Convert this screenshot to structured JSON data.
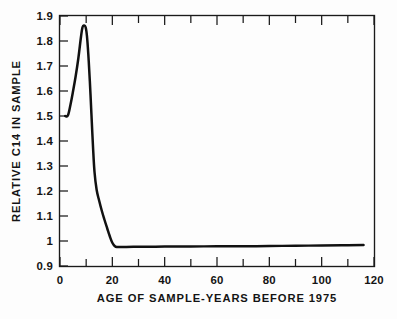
{
  "figure": {
    "background_color": "#fdfdfd",
    "ink_color": "#141414"
  },
  "chart_data": {
    "type": "line",
    "title": "",
    "subtitle": "",
    "xlabel": "AGE OF SAMPLE-YEARS BEFORE 1975",
    "ylabel": "RELATIVE C14 IN SAMPLE",
    "xlim": [
      0,
      120
    ],
    "ylim": [
      0.9,
      1.9
    ],
    "grid": false,
    "legend": null,
    "x_ticks_major": [
      0,
      20,
      40,
      60,
      80,
      100,
      120
    ],
    "x_tick_labels": [
      "0",
      "20",
      "40",
      "60",
      "80",
      "100",
      "120"
    ],
    "x_ticks_minor": [
      10,
      30,
      50,
      70,
      90,
      110
    ],
    "y_ticks": [
      0.9,
      1.0,
      1.1,
      1.2,
      1.3,
      1.4,
      1.5,
      1.6,
      1.7,
      1.8,
      1.9
    ],
    "y_tick_labels": [
      "0.9",
      "1",
      "1.1",
      "1.2",
      "1.3",
      "1.4",
      "1.5",
      "1.6",
      "1.7",
      "1.8",
      "1.9"
    ],
    "series": [
      {
        "name": "Relative C14 in sample",
        "x": [
          2.0,
          3.0,
          4.0,
          5.0,
          6.0,
          7.0,
          8.0,
          8.6,
          9.2,
          9.8,
          10.3,
          10.8,
          11.4,
          12.0,
          12.6,
          13.2,
          14.0,
          15.0,
          16.0,
          17.0,
          18.0,
          19.0,
          20.0,
          21.0,
          22.0,
          24.0,
          28.0,
          34.0,
          40.0,
          50.0,
          60.0,
          70.0,
          80.0,
          90.0,
          100.0,
          110.0,
          116.0
        ],
        "y": [
          1.5,
          1.502,
          1.545,
          1.6,
          1.66,
          1.73,
          1.815,
          1.855,
          1.862,
          1.855,
          1.82,
          1.75,
          1.64,
          1.51,
          1.38,
          1.275,
          1.205,
          1.16,
          1.12,
          1.085,
          1.052,
          1.02,
          0.993,
          0.979,
          0.976,
          0.976,
          0.977,
          0.977,
          0.978,
          0.978,
          0.979,
          0.979,
          0.98,
          0.981,
          0.982,
          0.983,
          0.984
        ]
      }
    ],
    "annotations": []
  },
  "axes": {
    "x_axis_label": "AGE OF SAMPLE-YEARS BEFORE 1975",
    "y_axis_label": "RELATIVE C14 IN SAMPLE"
  }
}
